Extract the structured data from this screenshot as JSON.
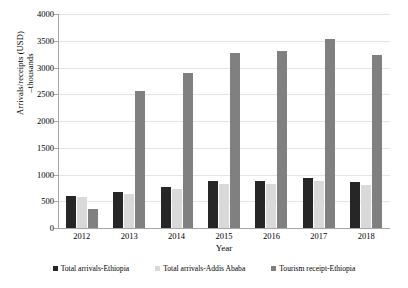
{
  "chart_data": {
    "type": "bar",
    "title": "",
    "xlabel": "Year",
    "ylabel": "Arrivals/receipts (USD) –thousands",
    "ylabel_line1": "Arrivals/receipts (USD)",
    "ylabel_line2": "–thousands",
    "categories": [
      "2012",
      "2013",
      "2014",
      "2015",
      "2016",
      "2017",
      "2018"
    ],
    "ylim": [
      0,
      4000
    ],
    "yticks": [
      0,
      500,
      1000,
      1500,
      2000,
      2500,
      3000,
      3500,
      4000
    ],
    "ytick_labels": [
      "0",
      "500",
      "1000",
      "1500",
      "2000",
      "2500",
      "3000",
      "3500",
      "4000"
    ],
    "grid": true,
    "legend_position": "bottom",
    "series": [
      {
        "name": "Total arrivals-Ethiopia",
        "color": "#262626",
        "values": [
          600,
          680,
          770,
          870,
          870,
          930,
          860
        ]
      },
      {
        "name": "Total arrivals-Addis Ababa",
        "color": "#d9d9d9",
        "values": [
          580,
          640,
          730,
          830,
          820,
          880,
          810
        ]
      },
      {
        "name": "Tourism receipt-Ethiopia",
        "color": "#808080",
        "values": [
          350,
          2560,
          2900,
          3280,
          3300,
          3530,
          3230
        ]
      }
    ]
  }
}
